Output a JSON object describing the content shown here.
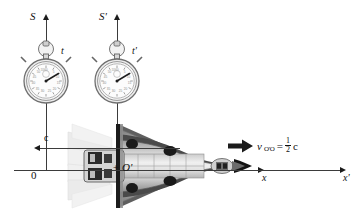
{
  "figure": {
    "background_color": "#ffffff",
    "line_color": "#3b3b3b",
    "text_color": "#111111"
  },
  "frames": [
    {
      "id": "S",
      "axis_label": "S",
      "clock_label": "t",
      "clock_name": "stopwatch-s"
    },
    {
      "id": "S-prime",
      "axis_label": "S'",
      "clock_label": "t'",
      "clock_name": "stopwatch-s-prime"
    }
  ],
  "axes": {
    "origin_label": "0",
    "moving_origin_label": "O'",
    "x_label": "x",
    "x_prime_label": "x'",
    "vertical_s_label": "S",
    "vertical_s_prime_label": "S'"
  },
  "annotations": {
    "light_speed_label": "c",
    "velocity": {
      "symbol": "v",
      "subscript": "O'O",
      "equals": "=",
      "numerator": "1",
      "denominator": "2",
      "unit": "c",
      "full_text": "v_O'O = 1/2 c"
    }
  },
  "stopwatch_dial": {
    "tick_numbers": [
      "5",
      "10",
      "15",
      "20",
      "25",
      "30",
      "35",
      "40",
      "45",
      "50",
      "55",
      "60"
    ],
    "hand_angle_degrees": 55
  }
}
